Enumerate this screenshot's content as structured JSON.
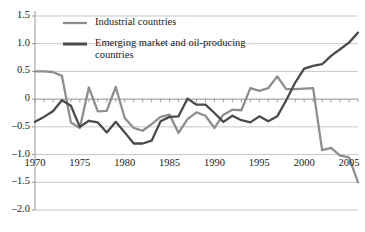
{
  "chart_data": {
    "type": "line",
    "title": "",
    "subtitle": "",
    "xlabel": "",
    "ylabel": "",
    "xlim": [
      1970,
      2006
    ],
    "ylim": [
      -2.0,
      1.5
    ],
    "grid": true,
    "legend_position": "top-left-inside",
    "y_ticks": [
      "1.5",
      "1.0",
      "0.5",
      "0",
      "-0.5",
      "-1.0",
      "-1.5",
      "-2.0"
    ],
    "y_tick_values": [
      1.5,
      1.0,
      0.5,
      0,
      -0.5,
      -1.0,
      -1.5,
      -2.0
    ],
    "x_ticks": [
      "1970",
      "1975",
      "1980",
      "1985",
      "1990",
      "1995",
      "2000",
      "2005"
    ],
    "x_tick_values": [
      1970,
      1975,
      1980,
      1985,
      1990,
      1995,
      2000,
      2005
    ],
    "x": [
      1970,
      1971,
      1972,
      1973,
      1974,
      1975,
      1976,
      1977,
      1978,
      1979,
      1980,
      1981,
      1982,
      1983,
      1984,
      1985,
      1986,
      1987,
      1988,
      1989,
      1990,
      1991,
      1992,
      1993,
      1994,
      1995,
      1996,
      1997,
      1998,
      1999,
      2000,
      2001,
      2002,
      2003,
      2004,
      2005,
      2006
    ],
    "series": [
      {
        "name": "Industrial countries",
        "color": "#8e8e8e",
        "values": [
          0.5,
          0.5,
          0.49,
          0.42,
          -0.42,
          -0.52,
          0.21,
          -0.22,
          -0.21,
          0.22,
          -0.34,
          -0.52,
          -0.57,
          -0.45,
          -0.32,
          -0.28,
          -0.61,
          -0.36,
          -0.24,
          -0.3,
          -0.52,
          -0.28,
          -0.19,
          -0.2,
          0.2,
          0.15,
          0.2,
          0.41,
          0.18,
          0.18,
          0.19,
          0.2,
          -0.92,
          -0.88,
          -1.02,
          -1.05,
          -1.5
        ]
      },
      {
        "name": "Emerging market and oil-producing countries",
        "color": "#4a4a4a",
        "values": [
          -0.41,
          -0.32,
          -0.22,
          -0.02,
          -0.12,
          -0.5,
          -0.39,
          -0.42,
          -0.6,
          -0.41,
          -0.6,
          -0.8,
          -0.8,
          -0.75,
          -0.4,
          -0.32,
          -0.31,
          0.01,
          -0.1,
          -0.1,
          -0.25,
          -0.41,
          -0.3,
          -0.38,
          -0.42,
          -0.31,
          -0.4,
          -0.31,
          -0.02,
          0.3,
          0.55,
          0.6,
          0.63,
          0.78,
          0.9,
          1.02,
          1.2
        ]
      }
    ],
    "legend": [
      {
        "label": "Industrial countries",
        "color": "#8e8e8e"
      },
      {
        "label": "Emerging market and oil-producing",
        "color": "#4a4a4a"
      },
      {
        "label": "countries",
        "color": "#4a4a4a"
      }
    ]
  }
}
